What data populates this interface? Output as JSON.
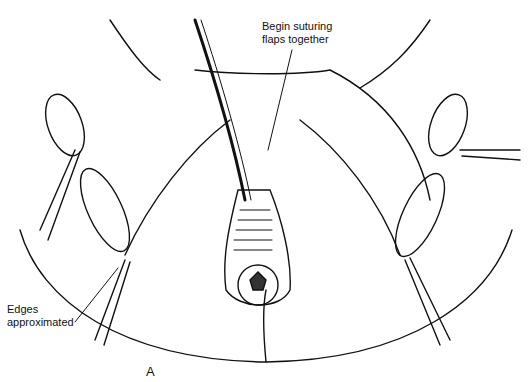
{
  "figure": {
    "panel_letter": "A",
    "labels": {
      "top": [
        "Begin suturing",
        "flaps together"
      ],
      "left": [
        "Edges",
        "approximated"
      ]
    }
  }
}
